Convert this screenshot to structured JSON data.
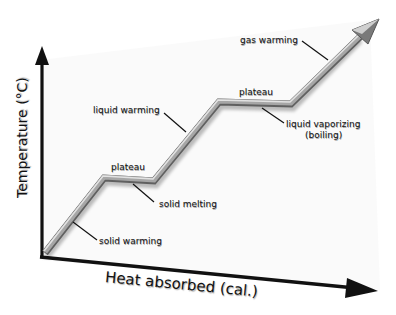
{
  "diagram": {
    "type": "heating-curve",
    "axes": {
      "y_label": "Temperature (°C)",
      "x_label": "Heat absorbed (cal.)"
    },
    "segments": [
      {
        "id": "solid-warming",
        "label": "solid warming"
      },
      {
        "id": "solid-melting",
        "label": "solid melting",
        "plateau_label": "plateau"
      },
      {
        "id": "liquid-warming",
        "label": "liquid warming"
      },
      {
        "id": "liquid-vaporizing",
        "label": "liquid vaporizing",
        "sublabel": "(boiling)",
        "plateau_label": "plateau"
      },
      {
        "id": "gas-warming",
        "label": "gas warming"
      }
    ],
    "colors": {
      "axis": "#111111",
      "curve_light": "#d8d8d8",
      "curve_mid": "#9a9a9a",
      "curve_dark": "#555555",
      "background": "#ffffff"
    }
  }
}
